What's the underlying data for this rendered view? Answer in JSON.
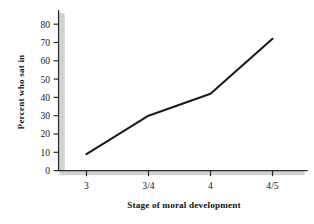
{
  "chart_data": {
    "type": "line",
    "title": "",
    "subtitle": "",
    "xlabel": "Stage of moral development",
    "ylabel": "Percent who sat in",
    "categories": [
      "3",
      "3/4",
      "4",
      "4/5"
    ],
    "values": [
      9,
      30,
      42,
      72
    ],
    "series": [
      {
        "name": "Percent who sat in",
        "values": [
          9,
          30,
          42,
          72
        ]
      }
    ],
    "ylim": [
      0,
      80
    ],
    "ytick_labels": [
      "0",
      "10",
      "20",
      "30",
      "40",
      "50",
      "60",
      "70",
      "80"
    ],
    "ytick_values": [
      0,
      10,
      20,
      30,
      40,
      50,
      60,
      70,
      80
    ],
    "xtick_labels": [
      "3",
      "3/4",
      "4",
      "4/5"
    ],
    "grid": false,
    "legend": false,
    "legend_position": "none",
    "line_color": "#1c1c1c",
    "axis_color": "#2b2b2b",
    "axis_shadow_color": "#d2d2d2",
    "background_color": "#ffffff",
    "annotations": []
  }
}
